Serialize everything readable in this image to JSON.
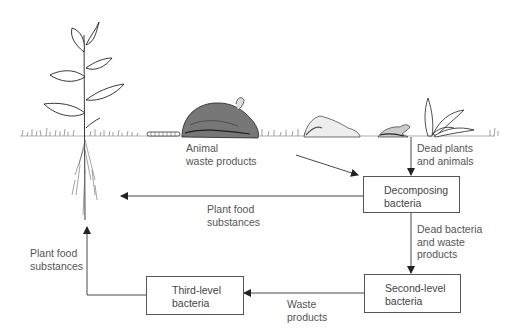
{
  "diagram": {
    "nodes": [
      {
        "id": "decomposing",
        "label_line1": "Decomposing",
        "label_line2": "bacteria"
      },
      {
        "id": "second",
        "label_line1": "Second-level",
        "label_line2": "bacteria"
      },
      {
        "id": "third",
        "label_line1": "Third-level",
        "label_line2": "bacteria"
      }
    ],
    "edges": [
      {
        "from": "animal",
        "to": "decomposing",
        "label": "Animal\nwaste products"
      },
      {
        "from": "dead-organisms",
        "to": "decomposing",
        "label": "Dead plants\nand animals"
      },
      {
        "from": "decomposing",
        "to": "plant",
        "label": "Plant food\nsubstances"
      },
      {
        "from": "decomposing",
        "to": "second",
        "label": "Dead bacteria\nand waste\nproducts"
      },
      {
        "from": "second",
        "to": "third",
        "label": "Waste\nproducts"
      },
      {
        "from": "third",
        "to": "plant",
        "label": "Plant food\nsubstances"
      }
    ],
    "illustrations": [
      "plant-with-roots",
      "caterpillar",
      "rabbit",
      "rock",
      "bird",
      "dead-plant",
      "grass-ground-line"
    ],
    "colors": {
      "line": "#333333",
      "text": "#555555",
      "background": "#ffffff"
    }
  }
}
